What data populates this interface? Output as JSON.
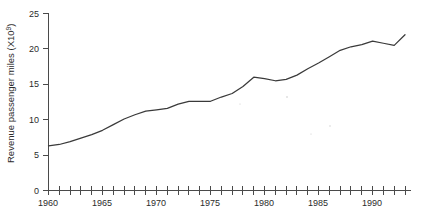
{
  "chart_data": {
    "type": "line",
    "title": "",
    "xlabel": "",
    "ylabel": "Revenue passenger miles (X10⁹)",
    "ylabel_base": "Revenue passenger miles (X10",
    "ylabel_exponent": "9",
    "ylabel_close": ")",
    "xlim": [
      1960,
      1993
    ],
    "ylim": [
      0,
      25
    ],
    "grid": false,
    "legend": null,
    "y_ticks": [
      0,
      5,
      10,
      15,
      20,
      25
    ],
    "y_tick_labels": [
      "0",
      "5",
      "10",
      "15",
      "20",
      "25"
    ],
    "x_major_ticks": [
      1960,
      1965,
      1970,
      1975,
      1980,
      1985,
      1990
    ],
    "x_major_tick_labels": [
      "1960",
      "1965",
      "1970",
      "1975",
      "1980",
      "1985",
      "1990"
    ],
    "x_minor_tick_interval": 1,
    "x": [
      1960,
      1961,
      1962,
      1963,
      1964,
      1965,
      1966,
      1967,
      1968,
      1969,
      1970,
      1971,
      1972,
      1973,
      1974,
      1975,
      1976,
      1977,
      1978,
      1979,
      1980,
      1981,
      1982,
      1983,
      1984,
      1985,
      1986,
      1987,
      1988,
      1989,
      1990,
      1991,
      1992,
      1993
    ],
    "values": [
      6.3,
      6.5,
      6.9,
      7.4,
      7.9,
      8.5,
      9.3,
      10.1,
      10.7,
      11.2,
      11.4,
      11.6,
      12.2,
      12.6,
      12.6,
      12.6,
      13.2,
      13.7,
      14.7,
      16.0,
      15.8,
      15.5,
      15.7,
      16.3,
      17.2,
      18.0,
      18.9,
      19.8,
      20.3,
      20.6,
      21.1,
      20.8,
      20.5,
      22.0
    ],
    "series_name": "Revenue passenger miles"
  },
  "axes": {
    "y_axis_name": "vertical-axis",
    "x_axis_name": "horizontal-axis"
  }
}
